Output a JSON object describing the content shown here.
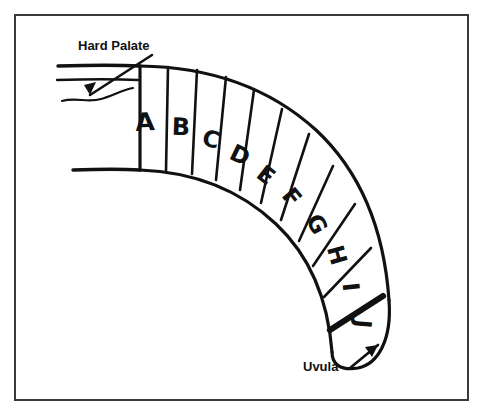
{
  "figure": {
    "background_color": "#ffffff",
    "ink_color": "#111111",
    "frame_color": "#3a3a3a"
  },
  "frame": {
    "x": 15,
    "y": 15,
    "width": 453,
    "height": 385
  },
  "callouts": [
    {
      "id": "hard-palate",
      "label": "Hard Palate",
      "text_x": 78,
      "text_y": 50,
      "leader": "M 152 55 L 90 95",
      "arrow": "M 90 95 L 96 82 L 84 85 Z"
    },
    {
      "id": "uvula",
      "label": "Uvula",
      "text_x": 303,
      "text_y": 371,
      "leader": "M 350 368 L 378 345",
      "arrow": "M 378 345 L 365 347 L 372 357 Z"
    }
  ],
  "palate_lines": {
    "upper": "M 58 66 C 90 65 122 65 140 66",
    "lower": "M 57 80 C 88 79 118 79 138 80",
    "inner_base": "M 73 170 C 100 169 124 169 140 170",
    "squiggle": "M 62 101 C 76 97 88 103 101 99 C 112 96 122 90 133 88"
  },
  "arc": {
    "outer": "M 140 66 C 214 67 272 90 316 130 C 360 171 384 229 389 300",
    "inner": "M 140 170 C 196 172 242 192 276 224 C 310 256 328 300 332 352",
    "tip_cap": "M 389 300 C 392 340 378 364 358 368 C 340 371 332 364 332 352",
    "start_cap": "M 140 66 L 140 170"
  },
  "segments": [
    {
      "letter": "A",
      "divider": "M 168 67 L 166 171",
      "letter_x": 145,
      "letter_y": 122,
      "letter_size": 25,
      "letter_rotation": -3
    },
    {
      "letter": "B",
      "divider": "M 197 70 L 192 174",
      "letter_x": 181,
      "letter_y": 127,
      "letter_size": 24,
      "letter_rotation": 2
    },
    {
      "letter": "C",
      "divider": "M 226 77 L 216 180",
      "letter_x": 211,
      "letter_y": 139,
      "letter_size": 23,
      "letter_rotation": 13
    },
    {
      "letter": "D",
      "divider": "M 254 90 L 240 190",
      "letter_x": 240,
      "letter_y": 155,
      "letter_size": 23,
      "letter_rotation": 26
    },
    {
      "letter": "E",
      "divider": "M 282 109 L 261 203",
      "letter_x": 266,
      "letter_y": 175,
      "letter_size": 23,
      "letter_rotation": 38
    },
    {
      "letter": "F",
      "divider": "M 309 134 L 281 220",
      "letter_x": 292,
      "letter_y": 197,
      "letter_size": 23,
      "letter_rotation": 50
    },
    {
      "letter": "G",
      "divider": "M 333 166 L 299 241",
      "letter_x": 317,
      "letter_y": 224,
      "letter_size": 23,
      "letter_rotation": 62
    },
    {
      "letter": "H",
      "divider": "M 355 204 L 313 266",
      "letter_x": 337,
      "letter_y": 255,
      "letter_size": 23,
      "letter_rotation": 74
    },
    {
      "letter": "I",
      "divider": "M 371 248 L 324 297",
      "letter_x": 351,
      "letter_y": 287,
      "letter_size": 23,
      "letter_rotation": 84
    },
    {
      "letter": "J",
      "divider": "M 383 296 L 330 330",
      "divider_weight": "thick",
      "letter_x": 363,
      "letter_y": 324,
      "letter_size": 23,
      "letter_rotation": 95
    }
  ]
}
